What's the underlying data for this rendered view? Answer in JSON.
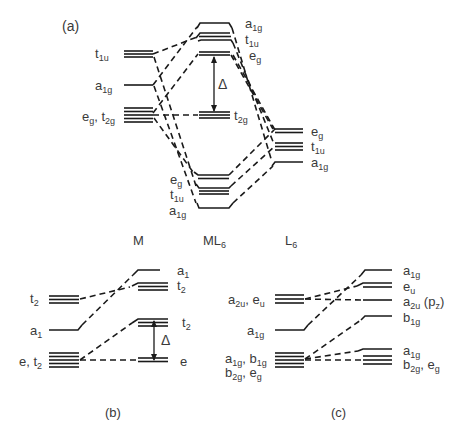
{
  "figure": {
    "panel_a": {
      "label": "(a)",
      "columns": {
        "metal": "M",
        "complex": "ML",
        "complex_sub": "6",
        "ligands": "L",
        "ligands_sub": "6"
      },
      "metal_levels": [
        {
          "sym": "t",
          "sub": "1u"
        },
        {
          "sym": "a",
          "sub": "1g"
        },
        {
          "sym": "e",
          "sub": "g",
          "sym2": "t",
          "sub2": "2g",
          "sep": ", "
        }
      ],
      "complex_upper": [
        {
          "sym": "a",
          "sub": "1g"
        },
        {
          "sym": "t",
          "sub": "1u"
        },
        {
          "sym": "e",
          "sub": "g"
        },
        {
          "sym": "t",
          "sub": "2g"
        }
      ],
      "delta": "Δ",
      "ligand_levels": [
        {
          "sym": "e",
          "sub": "g"
        },
        {
          "sym": "t",
          "sub": "1u"
        },
        {
          "sym": "a",
          "sub": "1g"
        }
      ],
      "complex_lower": [
        {
          "sym": "e",
          "sub": "g"
        },
        {
          "sym": "t",
          "sub": "1u"
        },
        {
          "sym": "a",
          "sub": "1g"
        }
      ]
    },
    "panel_b": {
      "label": "(b)",
      "left_levels": [
        {
          "sym": "t",
          "sub": "2"
        },
        {
          "sym": "a",
          "sub": "1"
        },
        {
          "sym": "e",
          "sub": "",
          "sym2": "t",
          "sub2": "2",
          "sep": ", "
        }
      ],
      "right_levels": [
        {
          "sym": "a",
          "sub": "1"
        },
        {
          "sym": "t",
          "sub": "2"
        },
        {
          "sym": "t",
          "sub": "2"
        },
        {
          "sym": "e",
          "sub": ""
        }
      ],
      "delta": "Δ"
    },
    "panel_c": {
      "label": "(c)",
      "left_levels": [
        {
          "text": "a",
          "sub": "2u",
          "text2": ", e",
          "sub2": "u"
        },
        {
          "text": "a",
          "sub": "1g"
        },
        {
          "text": "a",
          "sub": "1g",
          "text2": ", b",
          "sub2": "1g"
        },
        {
          "text": "b",
          "sub": "2g",
          "text2": ", e",
          "sub2": "g"
        }
      ],
      "right_levels": [
        {
          "text": "a",
          "sub": "1g"
        },
        {
          "text": "e",
          "sub": "u"
        },
        {
          "text": "a",
          "sub": "2u",
          "text2": " (p",
          "sub2": "z",
          "text3": ")"
        },
        {
          "text": "b",
          "sub": "1g"
        },
        {
          "text": "a",
          "sub": "1g"
        },
        {
          "text": "b",
          "sub": "2g",
          "text2": ", e",
          "sub2": "g"
        }
      ]
    }
  }
}
